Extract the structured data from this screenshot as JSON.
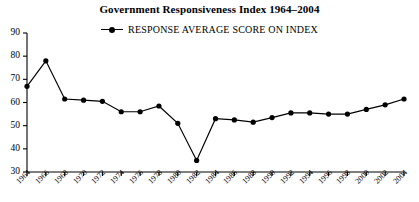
{
  "chart_data": {
    "type": "line",
    "title": "Government Responsiveness Index 1964–2004",
    "xlabel": "",
    "ylabel": "",
    "ylim": [
      30,
      90
    ],
    "yticks": [
      30,
      40,
      50,
      60,
      70,
      80,
      90
    ],
    "grid": false,
    "legend_position": "top-center",
    "legend": [
      "RESPONSE AVERAGE SCORE ON INDEX"
    ],
    "marker": "filled-circle",
    "line_color": "#000000",
    "categories": [
      "1964",
      "1966",
      "1968",
      "1970",
      "1972",
      "1974",
      "1976",
      "1978",
      "1980",
      "1982",
      "1984",
      "1986",
      "1988",
      "1990",
      "1992",
      "1994",
      "1996",
      "1998",
      "2000",
      "2002",
      "2004"
    ],
    "series": [
      {
        "name": "RESPONSE AVERAGE SCORE ON INDEX",
        "values": [
          67,
          78,
          61.5,
          61,
          60.5,
          56,
          56,
          58.5,
          51,
          35,
          53,
          52.5,
          51.5,
          53.5,
          55.5,
          55.5,
          55,
          55,
          57,
          59,
          61.5
        ]
      }
    ]
  },
  "chart": {
    "title": "Government Responsiveness Index 1964–2004",
    "legend_label": "RESPONSE AVERAGE SCORE ON INDEX"
  }
}
